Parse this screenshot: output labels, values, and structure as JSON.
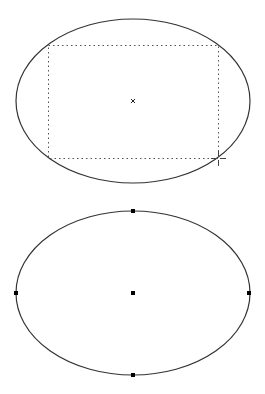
{
  "canvas": {
    "width": 265,
    "height": 394,
    "background": "#ffffff",
    "stroke": "#333333"
  },
  "ellipse_drawing": {
    "ellipse": {
      "cx": 133,
      "cy": 101,
      "rx": 117,
      "ry": 82
    },
    "bounding_rect": {
      "x": 48,
      "y": 45,
      "width": 170,
      "height": 113
    },
    "center_marker": {
      "x": 133,
      "y": 101,
      "glyph": "x-mark-icon"
    },
    "cursor": {
      "x": 218,
      "y": 158,
      "glyph": "crosshair-icon"
    }
  },
  "ellipse_selected": {
    "ellipse": {
      "cx": 133,
      "cy": 293,
      "rx": 117,
      "ry": 82
    },
    "handles": [
      {
        "name": "top",
        "x": 133,
        "y": 211
      },
      {
        "name": "left",
        "x": 16,
        "y": 293
      },
      {
        "name": "center",
        "x": 133,
        "y": 293
      },
      {
        "name": "right",
        "x": 249,
        "y": 293
      },
      {
        "name": "bottom",
        "x": 133,
        "y": 375
      }
    ]
  }
}
